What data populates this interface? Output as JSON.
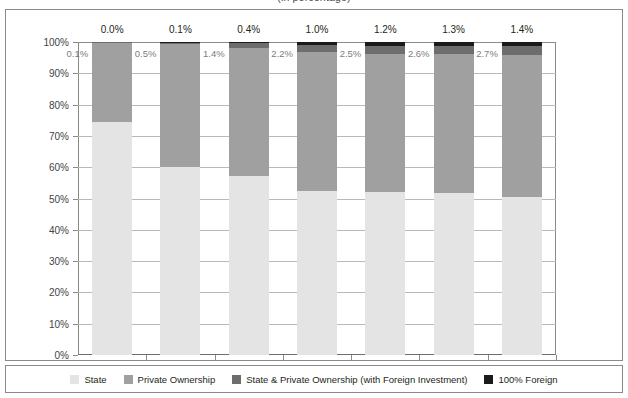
{
  "figure": {
    "title_clipped": "(in percentage)"
  },
  "chart_data": {
    "type": "bar",
    "stacked": true,
    "stack_mode": "percent",
    "title": "(in percentage)",
    "xlabel": "",
    "ylabel": "",
    "ylim": [
      0,
      100
    ],
    "ytick_labels": [
      "0%",
      "10%",
      "20%",
      "30%",
      "40%",
      "50%",
      "60%",
      "70%",
      "80%",
      "90%",
      "100%"
    ],
    "ytick_values": [
      0,
      10,
      20,
      30,
      40,
      50,
      60,
      70,
      80,
      90,
      100
    ],
    "grid": true,
    "legend_position": "bottom",
    "categories": [
      "1990",
      "1995",
      "2000",
      "2003",
      "2004",
      "2005",
      "2006"
    ],
    "series": [
      {
        "name": "State",
        "color": "#e4e4e4",
        "values": [
          74.4,
          60.0,
          57.2,
          52.4,
          52.0,
          51.8,
          50.6
        ]
      },
      {
        "name": "Private Ownership",
        "color": "#a0a0a0",
        "values": [
          25.5,
          39.4,
          41.0,
          44.4,
          44.3,
          44.3,
          45.3
        ]
      },
      {
        "name": "State & Private Ownership (with Foreign Investment)",
        "color": "#6d6d6d",
        "values": [
          0.1,
          0.5,
          1.4,
          2.2,
          2.5,
          2.6,
          2.7
        ]
      },
      {
        "name": "100% Foreign",
        "color": "#1a1a1a",
        "values": [
          0.0,
          0.1,
          0.4,
          1.0,
          1.2,
          1.3,
          1.4
        ]
      }
    ],
    "inside_labels": [
      "0.1%",
      "0.5%",
      "1.4%",
      "2.2%",
      "2.5%",
      "2.6%",
      "2.7%"
    ],
    "top_labels": [
      "0.0%",
      "0.1%",
      "0.4%",
      "1.0%",
      "1.2%",
      "1.3%",
      "1.4%"
    ]
  },
  "legend": {
    "items": [
      {
        "label": "State",
        "color": "#e4e4e4"
      },
      {
        "label": "Private Ownership",
        "color": "#a0a0a0"
      },
      {
        "label": "State & Private Ownership (with Foreign Investment)",
        "color": "#6d6d6d"
      },
      {
        "label": "100% Foreign",
        "color": "#1a1a1a"
      }
    ]
  },
  "colors": {
    "frame": "#8a8a8a",
    "gridline": "#b9b9b9",
    "axis_text": "#444444",
    "inside_label_text": "#7d7d7d",
    "background": "#ffffff"
  }
}
